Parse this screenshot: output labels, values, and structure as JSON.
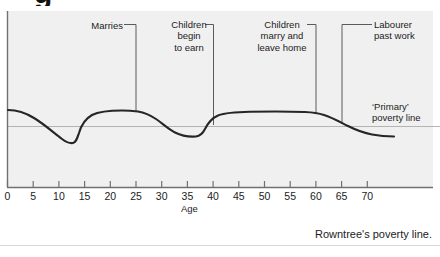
{
  "heading": {
    "cut_off_glyph": "g"
  },
  "caption": {
    "text": "Rowntree's poverty line."
  },
  "annotations": {
    "marries": {
      "lines": [
        "Marries"
      ]
    },
    "children_begin_to_earn": {
      "lines": [
        "Children",
        "begin",
        "to earn"
      ]
    },
    "children_marry_leave": {
      "lines": [
        "Children",
        "marry and",
        "leave home"
      ]
    },
    "labourer_past_work": {
      "lines": [
        "Labourer",
        "past work"
      ]
    },
    "primary_poverty_line": {
      "lines": [
        "‘Primary’",
        "poverty line"
      ]
    }
  },
  "chart_data": {
    "type": "line",
    "title": "Rowntree's poverty line.",
    "xlabel": "Age",
    "ylabel": "",
    "xlim": [
      0,
      73
    ],
    "ylim": [
      0,
      100
    ],
    "grid": false,
    "legend": "none",
    "colors": {
      "panel_background": "#f0f0f0",
      "page_background": "#ffffff",
      "curve": "#222222",
      "poverty_line": "#b0b0b0",
      "axis": "#6e6e6e",
      "text": "#1c1c1c"
    },
    "xticks": [
      0,
      5,
      10,
      15,
      20,
      25,
      30,
      35,
      40,
      45,
      50,
      55,
      60,
      65,
      70
    ],
    "xtick_labels": [
      "0",
      "5",
      "10",
      "15",
      "20",
      "25",
      "30",
      "35",
      "40",
      "45",
      "50",
      "55",
      "60",
      "65",
      "70"
    ],
    "reference_lines": [
      {
        "name": "'Primary' poverty line",
        "orientation": "horizontal",
        "y": 50
      }
    ],
    "series": [
      {
        "name": "Income relative to primary poverty line",
        "points": [
          {
            "x": 0,
            "y": 62
          },
          {
            "x": 2,
            "y": 61
          },
          {
            "x": 4,
            "y": 57
          },
          {
            "x": 6,
            "y": 51
          },
          {
            "x": 8,
            "y": 43
          },
          {
            "x": 10,
            "y": 36
          },
          {
            "x": 12,
            "y": 31
          },
          {
            "x": 13,
            "y": 30
          },
          {
            "x": 14,
            "y": 34
          },
          {
            "x": 15,
            "y": 48
          },
          {
            "x": 16,
            "y": 55
          },
          {
            "x": 18,
            "y": 59
          },
          {
            "x": 20,
            "y": 61
          },
          {
            "x": 23,
            "y": 63
          },
          {
            "x": 25,
            "y": 62
          },
          {
            "x": 27,
            "y": 59
          },
          {
            "x": 29,
            "y": 54
          },
          {
            "x": 31,
            "y": 48
          },
          {
            "x": 33,
            "y": 43
          },
          {
            "x": 35,
            "y": 39
          },
          {
            "x": 37,
            "y": 37
          },
          {
            "x": 38,
            "y": 37
          },
          {
            "x": 39,
            "y": 41
          },
          {
            "x": 40,
            "y": 50
          },
          {
            "x": 41,
            "y": 56
          },
          {
            "x": 43,
            "y": 59
          },
          {
            "x": 46,
            "y": 61
          },
          {
            "x": 50,
            "y": 62
          },
          {
            "x": 54,
            "y": 62
          },
          {
            "x": 57,
            "y": 61
          },
          {
            "x": 60,
            "y": 58
          },
          {
            "x": 63,
            "y": 54
          },
          {
            "x": 66,
            "y": 49
          },
          {
            "x": 68,
            "y": 45
          },
          {
            "x": 70,
            "y": 41
          },
          {
            "x": 72,
            "y": 39
          },
          {
            "x": 73,
            "y": 39
          }
        ]
      }
    ],
    "annotations": [
      {
        "label": "Marries",
        "x": 25,
        "text_lines": [
          "Marries"
        ]
      },
      {
        "label": "Children begin to earn",
        "x": 40,
        "text_lines": [
          "Children",
          "begin",
          "to earn"
        ]
      },
      {
        "label": "Children marry and leave home",
        "x": 60,
        "text_lines": [
          "Children",
          "marry and",
          "leave home"
        ]
      },
      {
        "label": "Labourer past work",
        "x": 66,
        "text_lines": [
          "Labourer",
          "past work"
        ]
      },
      {
        "label": "'Primary' poverty line",
        "text_lines": [
          "‘Primary’",
          "poverty line"
        ]
      }
    ]
  }
}
